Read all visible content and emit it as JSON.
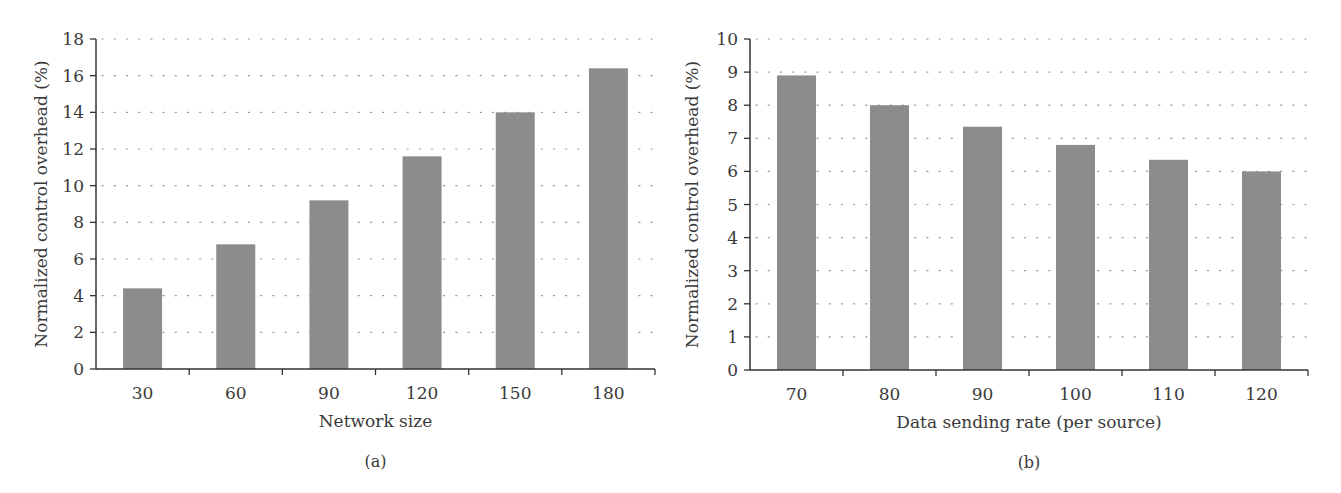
{
  "chart_data": [
    {
      "type": "bar",
      "panel_label": "(a)",
      "title": "",
      "xlabel": "Network size",
      "ylabel": "Normalized control overhead (%)",
      "categories": [
        "30",
        "60",
        "90",
        "120",
        "150",
        "180"
      ],
      "values": [
        4.4,
        6.8,
        9.2,
        11.6,
        14.0,
        16.4
      ],
      "ylim": [
        0,
        18
      ],
      "yticks": [
        "0",
        "2",
        "4",
        "6",
        "8",
        "10",
        "12",
        "14",
        "16",
        "18"
      ],
      "grid": "horizontal dotted",
      "legend": null,
      "bar_color": "#8c8c8c"
    },
    {
      "type": "bar",
      "panel_label": "(b)",
      "title": "",
      "xlabel": "Data sending rate (per source)",
      "ylabel": "Normalized control overhead (%)",
      "categories": [
        "70",
        "80",
        "90",
        "100",
        "110",
        "120"
      ],
      "values": [
        8.9,
        8.0,
        7.35,
        6.8,
        6.35,
        6.0
      ],
      "ylim": [
        0,
        10
      ],
      "yticks": [
        "0",
        "1",
        "2",
        "3",
        "4",
        "5",
        "6",
        "7",
        "8",
        "9",
        "10"
      ],
      "grid": "horizontal dotted",
      "legend": null,
      "bar_color": "#8c8c8c"
    }
  ]
}
